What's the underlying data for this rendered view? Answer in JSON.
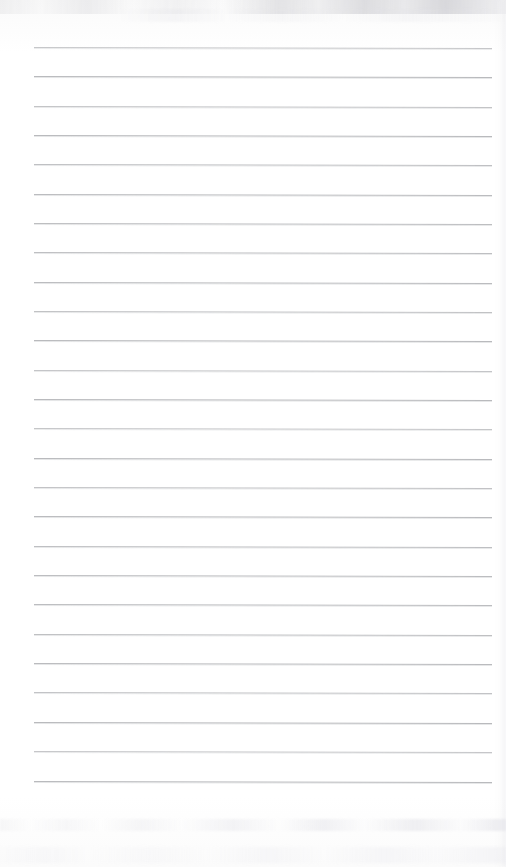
{
  "page": {
    "kind": "scanned-blank-lined-notebook-page",
    "width": 506,
    "height": 867,
    "background_color": "#ffffff",
    "paper_tone": "#fdfdfd",
    "text_content": "",
    "has_handwriting": false,
    "has_printed_text": false
  },
  "ruling": {
    "line_color": "#b9babd",
    "line_thickness_px": 1,
    "line_count": 26,
    "left_margin_x": 34,
    "right_margin_x": 492,
    "line_length_px": 458,
    "first_line_y": 47,
    "line_spacing_px": 29.3,
    "tilt_deg": 0.12,
    "vertical_margin_rule": false,
    "lines_y": [
      47,
      76,
      106,
      135,
      164,
      194,
      223,
      252,
      282,
      311,
      340,
      370,
      399,
      428,
      458,
      487,
      516,
      546,
      575,
      604,
      634,
      663,
      692,
      722,
      751,
      781
    ]
  },
  "artifacts": {
    "top_smudge_label": "scanner shadow band (top)",
    "bottom_smudge_label": "scanner shadow band (bottom)",
    "right_edge_label": "page edge shading (right)",
    "smudge_color": "#d5d5da"
  }
}
